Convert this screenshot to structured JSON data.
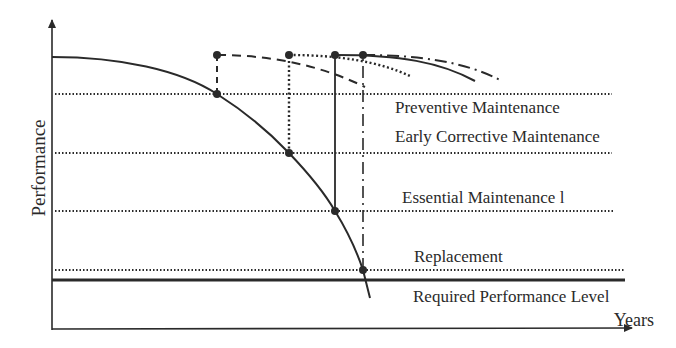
{
  "figure": {
    "type": "maintenance-performance-curve",
    "axes": {
      "y_label": "Performance",
      "x_label": "Years"
    },
    "levels": [
      {
        "id": "preventive",
        "label": "Preventive Maintenance",
        "y": 94
      },
      {
        "id": "early-corrective",
        "label": "Early Corrective Maintenance",
        "y": 153
      },
      {
        "id": "essential",
        "label": "Essential Maintenance l",
        "y": 211
      },
      {
        "id": "replacement",
        "label": "Replacement",
        "y": 270
      },
      {
        "id": "required",
        "label": "Required Performance Level",
        "y": 280
      }
    ],
    "interventions": [
      {
        "name": "preventive",
        "x": 217,
        "line_style": "dashed"
      },
      {
        "name": "early-corrective",
        "x": 289,
        "line_style": "dotted"
      },
      {
        "name": "essential",
        "x": 335,
        "line_style": "solid"
      },
      {
        "name": "replacement",
        "x": 363,
        "line_style": "dash-dot"
      }
    ],
    "colors": {
      "ink": "#2a2a2a",
      "background": "#ffffff"
    }
  }
}
